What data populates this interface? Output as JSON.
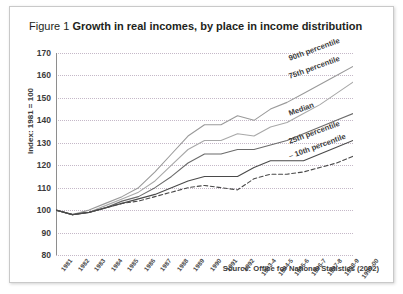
{
  "figure": {
    "number_label": "Figure 1",
    "title": "Growth in real incomes, by place in income distribution",
    "source": "Source: Office for National Statistics (2002)"
  },
  "chart_data": {
    "type": "line",
    "title": "Growth in real incomes, by place in income distribution",
    "xlabel": "",
    "ylabel": "Index: 1981 = 100",
    "ylim": [
      80,
      170
    ],
    "yticks": [
      80,
      90,
      100,
      110,
      120,
      130,
      140,
      150,
      160,
      170
    ],
    "grid": true,
    "legend_position": "right-inline",
    "categories": [
      "1981",
      "1982",
      "1983",
      "1984",
      "1985",
      "1986",
      "1987",
      "1988",
      "1989",
      "1990",
      "1991",
      "1992",
      "1993-4",
      "1994-5",
      "1995-6",
      "1996-7",
      "1997-8",
      "1998-9",
      "1999-00"
    ],
    "series": [
      {
        "name": "90th percentile",
        "style": "solid",
        "color": "#9a9a9a",
        "values": [
          100,
          98,
          100,
          103,
          106,
          110,
          117,
          125,
          133,
          138,
          138,
          142,
          140,
          145,
          148,
          152,
          156,
          160,
          164
        ]
      },
      {
        "name": "75th percentile",
        "style": "solid",
        "color": "#a8a8a8",
        "values": [
          100,
          98,
          99,
          102,
          105,
          108,
          113,
          120,
          127,
          131,
          131,
          134,
          133,
          137,
          139,
          143,
          147,
          152,
          157
        ]
      },
      {
        "name": "Median",
        "style": "solid",
        "color": "#6b6b6b",
        "values": [
          100,
          98,
          99,
          101,
          104,
          106,
          110,
          115,
          121,
          125,
          125,
          127,
          127,
          129,
          131,
          134,
          137,
          140,
          143
        ]
      },
      {
        "name": "25th percentile",
        "style": "solid",
        "color": "#4a4a4a",
        "values": [
          100,
          98,
          99,
          101,
          103,
          105,
          107,
          110,
          113,
          115,
          115,
          115,
          119,
          122,
          122,
          122,
          125,
          128,
          131
        ]
      },
      {
        "name": "10th percentile",
        "style": "dashed",
        "color": "#4a4a4a",
        "values": [
          100,
          98,
          99,
          101,
          103,
          104,
          106,
          108,
          110,
          111,
          110,
          109,
          114,
          116,
          116,
          117,
          119,
          121,
          124
        ]
      }
    ]
  }
}
